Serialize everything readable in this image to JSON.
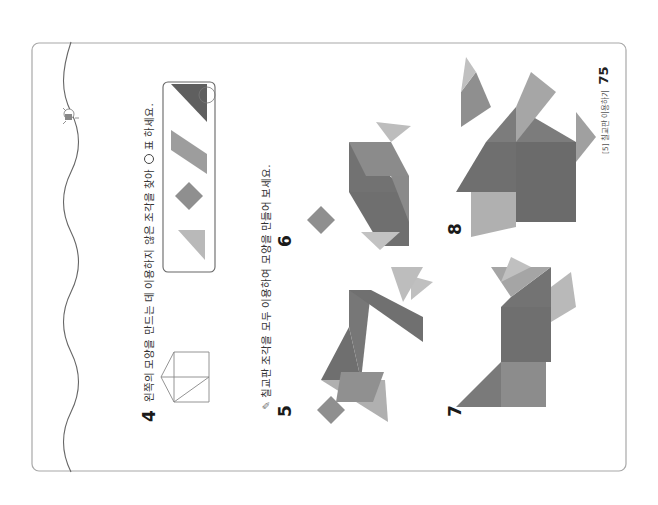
{
  "page": {
    "section_label": "[5] 칠교판 이용하기",
    "page_number": "75"
  },
  "problem4": {
    "number": "4",
    "text_before": "왼쪽의 모양을 만드는 데 이용하지 않은 조각을 찾아",
    "text_after": "표 하세요."
  },
  "section": {
    "icon": "pencil-icon",
    "instruction": "칠교판 조각을 모두 이용하여 모양을 만들어 보세요."
  },
  "problems": [
    {
      "number": "5"
    },
    {
      "number": "6"
    },
    {
      "number": "7"
    },
    {
      "number": "8"
    }
  ],
  "colors": {
    "dark": "#6f6f6f",
    "mid": "#8f8f8f",
    "light": "#b9b9b9",
    "frame": "#9a9a9a"
  }
}
